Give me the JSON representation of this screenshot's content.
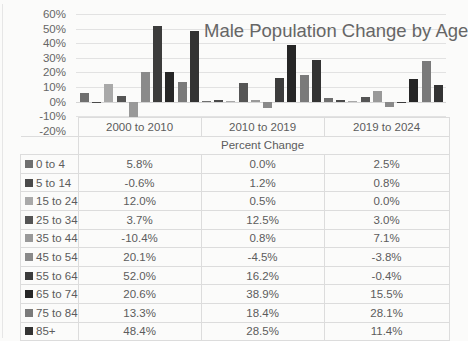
{
  "chart_data": {
    "type": "bar",
    "title": "Male Population Change by Age",
    "xlabel": "Percent Change",
    "ylabel": "",
    "ylim": [
      -0.2,
      0.6
    ],
    "yticks": [
      "60%",
      "50%",
      "40%",
      "30%",
      "20%",
      "10%",
      "0%",
      "-10%",
      "-20%"
    ],
    "grid": true,
    "legend_position": "data-table",
    "categories": [
      "2000 to 2010",
      "2010 to 2019",
      "2019 to 2024"
    ],
    "series": [
      {
        "name": "0 to 4",
        "color": "#6f6f6f",
        "values": [
          5.8,
          0.0,
          2.5
        ],
        "labels": [
          "5.8%",
          "0.0%",
          "2.5%"
        ]
      },
      {
        "name": "5 to 14",
        "color": "#4a4a4a",
        "values": [
          -0.6,
          1.2,
          0.8
        ],
        "labels": [
          "-0.6%",
          "1.2%",
          "0.8%"
        ]
      },
      {
        "name": "15 to 24",
        "color": "#a9a9a9",
        "values": [
          12.0,
          0.5,
          0.0
        ],
        "labels": [
          "12.0%",
          "0.5%",
          "0.0%"
        ]
      },
      {
        "name": "25 to 34",
        "color": "#555555",
        "values": [
          3.7,
          12.5,
          3.0
        ],
        "labels": [
          "3.7%",
          "12.5%",
          "3.0%"
        ]
      },
      {
        "name": "35 to 44",
        "color": "#999999",
        "values": [
          -10.4,
          0.8,
          7.1
        ],
        "labels": [
          "-10.4%",
          "0.8%",
          "7.1%"
        ]
      },
      {
        "name": "45 to 54",
        "color": "#8a8a8a",
        "values": [
          20.1,
          -4.5,
          -3.8
        ],
        "labels": [
          "20.1%",
          "-4.5%",
          "-3.8%"
        ]
      },
      {
        "name": "55 to 64",
        "color": "#3c3c3c",
        "values": [
          52.0,
          16.2,
          -0.4
        ],
        "labels": [
          "52.0%",
          "16.2%",
          "-0.4%"
        ]
      },
      {
        "name": "65 to 74",
        "color": "#262626",
        "values": [
          20.6,
          38.9,
          15.5
        ],
        "labels": [
          "20.6%",
          "38.9%",
          "15.5%"
        ]
      },
      {
        "name": "75 to 84",
        "color": "#7a7a7a",
        "values": [
          13.3,
          18.4,
          28.1
        ],
        "labels": [
          "13.3%",
          "18.4%",
          "28.1%"
        ]
      },
      {
        "name": "85+",
        "color": "#333333",
        "values": [
          48.4,
          28.5,
          11.4
        ],
        "labels": [
          "48.4%",
          "28.5%",
          "11.4%"
        ]
      }
    ]
  },
  "table": {
    "header": [
      "2000 to 2010",
      "2010 to 2019",
      "2019 to 2024"
    ],
    "subheader": "Percent Change"
  }
}
